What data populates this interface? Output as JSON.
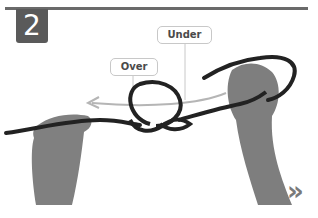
{
  "step": {
    "number": "2"
  },
  "callouts": {
    "under": "Under",
    "over": "Over"
  },
  "navigation": {
    "next_icon": "»"
  },
  "colors": {
    "badge": "#5a5a5a",
    "rule": "#6a6a6a",
    "rope": "#222222",
    "arrow": "#b0b0b0",
    "callout_border": "#c8c8c8",
    "hand": "#7d7d7d"
  }
}
